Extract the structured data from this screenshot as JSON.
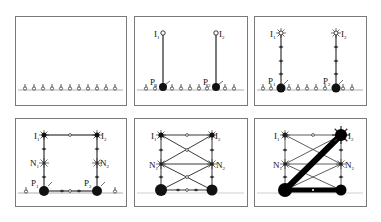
{
  "figure": {
    "colors": {
      "frame": "#7a7a7a",
      "ground": "#9a9a9a",
      "line": "#222222",
      "node": "#111111",
      "open_node": "#ffffff"
    }
  },
  "labels": {
    "I1": "I",
    "I1_sub": "1",
    "I2": "I",
    "I2_sub": "2",
    "P1": "P",
    "P1_sub": "1",
    "P2": "P",
    "P2_sub": "2",
    "N1": "N",
    "N1_sub": "1",
    "N2": "N",
    "N2_sub": "2"
  },
  "panels": [
    {
      "id": "panel-1",
      "row": 0,
      "col": 0,
      "stage": "ground sensors only",
      "sensor_count": 11
    },
    {
      "id": "panel-2",
      "row": 0,
      "col": 1,
      "stage": "I1/I2 connect straight to P1/P2"
    },
    {
      "id": "panel-3",
      "row": 0,
      "col": 2,
      "stage": "vertical chains with intermediate nodes"
    },
    {
      "id": "panel-4",
      "row": 1,
      "col": 0,
      "stage": "rectangular loop via N1/N2"
    },
    {
      "id": "panel-5",
      "row": 1,
      "col": 1,
      "stage": "cross-linked ladder"
    },
    {
      "id": "panel-6",
      "row": 1,
      "col": 2,
      "stage": "thick diagonal P1-I2 and P1-P2 paths"
    }
  ]
}
